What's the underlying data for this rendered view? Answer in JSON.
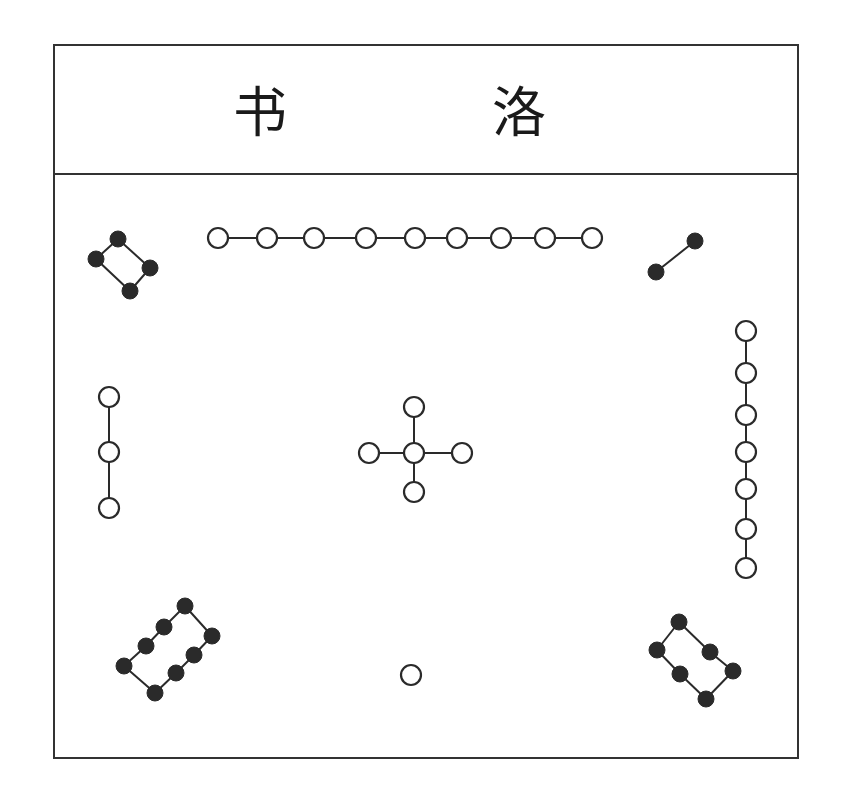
{
  "title": {
    "chars": [
      "书",
      "洛"
    ],
    "reading": "洛书 (Lo Shu)"
  },
  "style": {
    "border_color": "#333333",
    "dot_fill_dark": "#2a2a2a",
    "dot_fill_light": "#ffffff",
    "line_color": "#2a2a2a"
  },
  "groups": [
    {
      "name": "group-9-top",
      "count": 9,
      "fill": "hollow",
      "position": "top",
      "points": [
        [
          218,
          238
        ],
        [
          267,
          238
        ],
        [
          314,
          238
        ],
        [
          366,
          238
        ],
        [
          415,
          238
        ],
        [
          457,
          238
        ],
        [
          501,
          238
        ],
        [
          545,
          238
        ],
        [
          592,
          238
        ]
      ],
      "edges": [
        [
          0,
          1
        ],
        [
          1,
          2
        ],
        [
          2,
          3
        ],
        [
          3,
          4
        ],
        [
          4,
          5
        ],
        [
          5,
          6
        ],
        [
          6,
          7
        ],
        [
          7,
          8
        ]
      ]
    },
    {
      "name": "group-4-top-left",
      "count": 4,
      "fill": "solid",
      "position": "top-left",
      "points": [
        [
          118,
          239
        ],
        [
          96,
          259
        ],
        [
          150,
          268
        ],
        [
          130,
          291
        ]
      ],
      "edges": [
        [
          0,
          1
        ],
        [
          0,
          2
        ],
        [
          1,
          3
        ],
        [
          2,
          3
        ]
      ]
    },
    {
      "name": "group-2-top-right",
      "count": 2,
      "fill": "solid",
      "position": "top-right",
      "points": [
        [
          695,
          241
        ],
        [
          656,
          272
        ]
      ],
      "edges": [
        [
          0,
          1
        ]
      ]
    },
    {
      "name": "group-3-left",
      "count": 3,
      "fill": "hollow",
      "position": "left",
      "points": [
        [
          109,
          397
        ],
        [
          109,
          452
        ],
        [
          109,
          508
        ]
      ],
      "edges": [
        [
          0,
          1
        ],
        [
          1,
          2
        ]
      ]
    },
    {
      "name": "group-5-center",
      "count": 5,
      "fill": "hollow",
      "position": "center",
      "points": [
        [
          414,
          407
        ],
        [
          369,
          453
        ],
        [
          414,
          453
        ],
        [
          462,
          453
        ],
        [
          414,
          492
        ]
      ],
      "edges": [
        [
          0,
          2
        ],
        [
          1,
          2
        ],
        [
          2,
          3
        ],
        [
          2,
          4
        ]
      ]
    },
    {
      "name": "group-7-right",
      "count": 7,
      "fill": "hollow",
      "position": "right",
      "points": [
        [
          746,
          331
        ],
        [
          746,
          373
        ],
        [
          746,
          415
        ],
        [
          746,
          452
        ],
        [
          746,
          489
        ],
        [
          746,
          529
        ],
        [
          746,
          568
        ]
      ],
      "edges": [
        [
          0,
          1
        ],
        [
          1,
          2
        ],
        [
          2,
          3
        ],
        [
          3,
          4
        ],
        [
          4,
          5
        ],
        [
          5,
          6
        ]
      ]
    },
    {
      "name": "group-8-bottom-left",
      "count": 8,
      "fill": "solid",
      "position": "bottom-left",
      "points": [
        [
          185,
          606
        ],
        [
          164,
          627
        ],
        [
          146,
          646
        ],
        [
          124,
          666
        ],
        [
          212,
          636
        ],
        [
          194,
          655
        ],
        [
          176,
          673
        ],
        [
          155,
          693
        ]
      ],
      "edges": [
        [
          0,
          1
        ],
        [
          1,
          2
        ],
        [
          2,
          3
        ],
        [
          0,
          4
        ],
        [
          4,
          5
        ],
        [
          5,
          6
        ],
        [
          6,
          7
        ],
        [
          3,
          7
        ]
      ]
    },
    {
      "name": "group-1-bottom",
      "count": 1,
      "fill": "hollow",
      "position": "bottom",
      "points": [
        [
          411,
          675
        ]
      ],
      "edges": []
    },
    {
      "name": "group-6-bottom-right",
      "count": 6,
      "fill": "solid",
      "position": "bottom-right",
      "points": [
        [
          679,
          622
        ],
        [
          657,
          650
        ],
        [
          710,
          652
        ],
        [
          680,
          674
        ],
        [
          733,
          671
        ],
        [
          706,
          699
        ]
      ],
      "edges": [
        [
          0,
          1
        ],
        [
          0,
          2
        ],
        [
          1,
          3
        ],
        [
          2,
          4
        ],
        [
          3,
          5
        ],
        [
          4,
          5
        ]
      ]
    }
  ]
}
